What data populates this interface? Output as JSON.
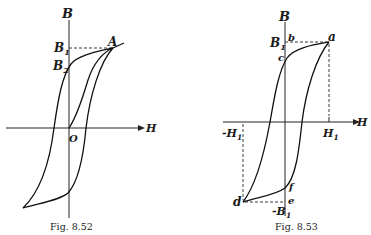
{
  "figures": [
    {
      "id": "fig-8-52",
      "caption": "Fig. 8.52",
      "labels": {
        "b_axis": "B",
        "h_axis": "H",
        "origin": "O",
        "b1": "B",
        "b1_sub": "1",
        "b2": "B",
        "b2_sub": "2",
        "point_a": "A"
      }
    },
    {
      "id": "fig-8-53",
      "caption": "Fig. 8.53",
      "labels": {
        "b_axis": "B",
        "h_axis": "H",
        "b1": "B",
        "b1_sub": "1",
        "neg_b1": "-B",
        "neg_b1_sub": "1",
        "h1": "H",
        "h1_sub": "1",
        "neg_h1": "-H",
        "neg_h1_sub": "1",
        "point_a": "a",
        "point_b": "b",
        "point_c": "c",
        "point_d": "d",
        "point_e": "e",
        "point_f": "f"
      }
    }
  ]
}
